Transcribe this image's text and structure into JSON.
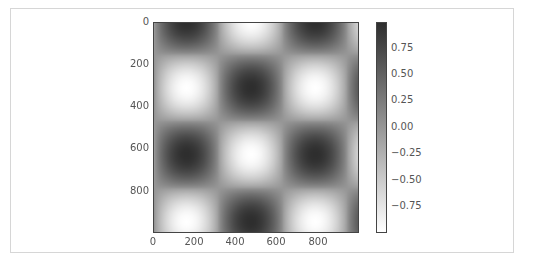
{
  "chart_data": {
    "type": "heatmap",
    "title": "",
    "xlabel": "",
    "ylabel": "",
    "colormap": "gray_r",
    "colormap_colors": {
      "high": "#2e2e2e",
      "low": "#ffffff"
    },
    "extent": {
      "x": [
        0,
        1000
      ],
      "y": [
        0,
        1000
      ]
    },
    "y_axis_inverted": true,
    "x_ticks": [
      "0",
      "200",
      "400",
      "600",
      "800"
    ],
    "y_ticks": [
      "0",
      "200",
      "400",
      "600",
      "800"
    ],
    "colorbar": {
      "range": [
        -1.0,
        1.0
      ],
      "ticks": [
        "0.75",
        "0.50",
        "0.25",
        "0.00",
        "−0.25",
        "−0.50",
        "−0.75"
      ],
      "tick_values": [
        0.75,
        0.5,
        0.25,
        0.0,
        -0.25,
        -0.5,
        -0.75
      ]
    },
    "function_description": "checkerboard of cosine products; minima (white) near (160,310),(470,0),(790,310),(470,620),(160,955),(790,955)",
    "minima_centers": [
      [
        160,
        310
      ],
      [
        470,
        0
      ],
      [
        790,
        310
      ],
      [
        470,
        620
      ],
      [
        160,
        955
      ],
      [
        790,
        955
      ]
    ],
    "maxima_centers": [
      [
        160,
        0
      ],
      [
        790,
        0
      ],
      [
        470,
        310
      ],
      [
        160,
        620
      ],
      [
        790,
        620
      ],
      [
        470,
        955
      ]
    ],
    "period": {
      "x": 630,
      "y": 640
    },
    "grid": false,
    "legend": "none"
  },
  "axes": {
    "x_ticks": [
      {
        "label": "0",
        "px": 153
      },
      {
        "label": "200",
        "px": 194
      },
      {
        "label": "400",
        "px": 235
      },
      {
        "label": "600",
        "px": 276
      },
      {
        "label": "800",
        "px": 318
      }
    ],
    "y_ticks": [
      {
        "label": "0",
        "px": 22
      },
      {
        "label": "200",
        "px": 64
      },
      {
        "label": "400",
        "px": 106
      },
      {
        "label": "600",
        "px": 148
      },
      {
        "label": "800",
        "px": 191
      }
    ]
  },
  "colorbar_ticks": [
    {
      "label": "0.75",
      "px": 48
    },
    {
      "label": "0.50",
      "px": 74
    },
    {
      "label": "0.25",
      "px": 100
    },
    {
      "label": "0.00",
      "px": 127
    },
    {
      "label": "−0.25",
      "px": 153
    },
    {
      "label": "−0.50",
      "px": 180
    },
    {
      "label": "−0.75",
      "px": 206
    }
  ]
}
